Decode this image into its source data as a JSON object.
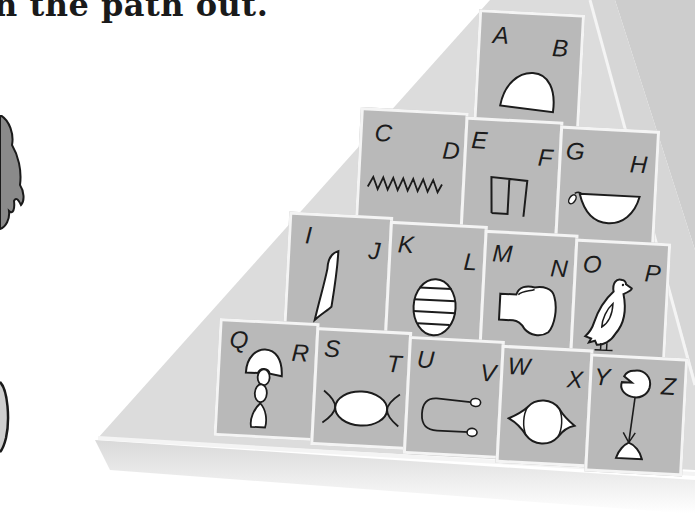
{
  "page": {
    "heading_fragment": "n the path out."
  },
  "colors": {
    "tile": "#b9b9b9",
    "pyramid_face_left": "#dcdcdc",
    "pyramid_face_right": "#cdcdcd",
    "outline": "#f4f4f4",
    "ink": "#1c1c1c"
  },
  "pyramid": {
    "rows": [
      {
        "tiles": [
          {
            "left_letter": "A",
            "right_letter": "B",
            "glyph": "bread-loaf-glyph"
          }
        ]
      },
      {
        "tiles": [
          {
            "left_letter": "C",
            "right_letter": "D",
            "glyph": "water-zigzag-glyph"
          },
          {
            "left_letter": "E",
            "right_letter": "F",
            "glyph": "house-plan-glyph"
          },
          {
            "left_letter": "G",
            "right_letter": "H",
            "glyph": "basket-handle-glyph"
          }
        ]
      },
      {
        "tiles": [
          {
            "left_letter": "I",
            "right_letter": "J",
            "glyph": "reed-leaf-glyph"
          },
          {
            "left_letter": "K",
            "right_letter": "L",
            "glyph": "striped-oval-glyph"
          },
          {
            "left_letter": "M",
            "right_letter": "N",
            "glyph": "fist-glyph"
          },
          {
            "left_letter": "O",
            "right_letter": "P",
            "glyph": "quail-chick-glyph"
          }
        ]
      },
      {
        "tiles": [
          {
            "left_letter": "Q",
            "right_letter": "R",
            "glyph": "twisted-flax-glyph"
          },
          {
            "left_letter": "S",
            "right_letter": "T",
            "glyph": "placenta-glyph"
          },
          {
            "left_letter": "U",
            "right_letter": "V",
            "glyph": "tether-rope-glyph"
          },
          {
            "left_letter": "W",
            "right_letter": "X",
            "glyph": "eye-shape-glyph"
          },
          {
            "left_letter": "Y",
            "right_letter": "Z",
            "glyph": "lotus-stand-glyph"
          }
        ]
      }
    ]
  }
}
